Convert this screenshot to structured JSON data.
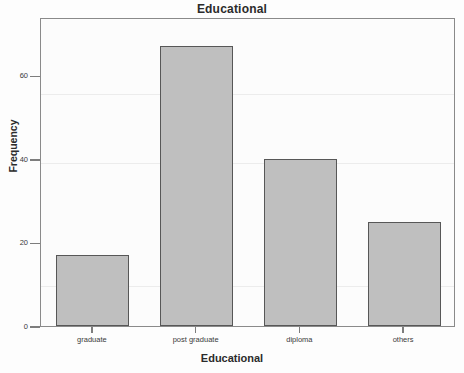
{
  "chart_data": {
    "type": "bar",
    "title": "Educational",
    "xlabel": "Educational",
    "ylabel": "Frequency",
    "categories": [
      "graduate",
      "post graduate",
      "diploma",
      "others"
    ],
    "values": [
      17,
      67,
      40,
      25
    ],
    "ytick_labels": [
      "0",
      "20",
      "40",
      "60"
    ],
    "ytick_values": [
      0,
      20,
      40,
      60
    ],
    "ylim": [
      0,
      74
    ],
    "grid": false,
    "legend": "none",
    "bar_fill_color": "#bfbfbf",
    "bar_border_color": "#575757",
    "plot_background_color": "#fcfcfc",
    "frame_color": "#8a8a8a",
    "text_color": "#2b2b2b"
  },
  "axis": {
    "y_title": "Frequency",
    "x_title": "Educational"
  },
  "title": "Educational"
}
